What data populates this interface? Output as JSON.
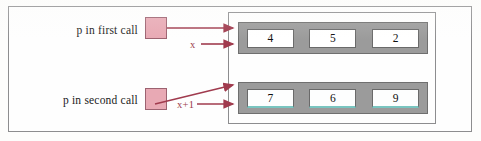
{
  "diagram": {
    "labels": {
      "first_call": "p in first  call",
      "second_call": "p in second  call"
    },
    "pointer_boxes": [
      {
        "name": "p-first-call",
        "fill": "#e8a9b4",
        "border": "#9c6270"
      },
      {
        "name": "p-second-call",
        "fill": "#e8a9b4",
        "border": "#9c6270"
      }
    ],
    "arrow_labels": {
      "x": "x",
      "x_plus_1": "x+1"
    },
    "arrays": [
      {
        "name": "array-row-x",
        "cells": [
          "4",
          "5",
          "2"
        ],
        "block_color": "#9b9b9b",
        "cell_color": "#ffffff"
      },
      {
        "name": "array-row-x-plus-1",
        "cells": [
          "7",
          "6",
          "9"
        ],
        "block_color": "#9b9b9b",
        "cell_color": "#fdfefe",
        "cell_underline_color": "#79c5c0"
      }
    ],
    "colors": {
      "arrow": "#a03b4e",
      "frame": "#8d8d8f",
      "text": "#1a1a1a"
    }
  }
}
